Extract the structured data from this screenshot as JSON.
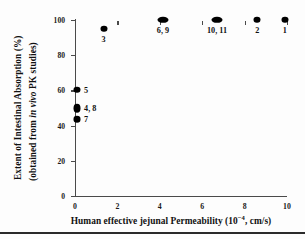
{
  "chart_data": {
    "type": "scatter",
    "title": "",
    "xlabel": "Human effective jejunal Permeability (10−4, cm/s)",
    "ylabel_line1": "Extent of Intestinal Absorption (%)",
    "ylabel_line2_pre": "(obtained from ",
    "ylabel_line2_italic": "in vivo",
    "ylabel_line2_post": " PK studies)",
    "xlim": [
      0,
      10
    ],
    "ylim": [
      0,
      100
    ],
    "xticks": [
      "0",
      "2",
      "4",
      "6",
      "8",
      "10"
    ],
    "xtick_values": [
      0,
      2,
      4,
      6,
      8,
      10
    ],
    "yticks": [
      "0",
      "20",
      "40",
      "60",
      "80",
      "100"
    ],
    "ytick_values": [
      0,
      20,
      40,
      60,
      80,
      100
    ],
    "grid": false,
    "legend": "none",
    "marker_color": "#000000",
    "axis_color": "#4a4a4a",
    "points": [
      {
        "label": "1",
        "x": 9.9,
        "y": 100,
        "label_pos": "below",
        "shape": "normal"
      },
      {
        "label": "2",
        "x": 8.6,
        "y": 100,
        "label_pos": "below",
        "shape": "normal"
      },
      {
        "label": "3",
        "x": 1.35,
        "y": 95.0,
        "label_pos": "below",
        "shape": "normal"
      },
      {
        "label": "4, 8",
        "x": 0.1,
        "y": 50.0,
        "label_pos": "right",
        "shape": "tall"
      },
      {
        "label": "5",
        "x": 0.1,
        "y": 60.5,
        "label_pos": "right",
        "shape": "normal"
      },
      {
        "label": "6, 9",
        "x": 4.15,
        "y": 100,
        "label_pos": "below",
        "shape": "wide"
      },
      {
        "label": "7",
        "x": 0.1,
        "y": 43.5,
        "label_pos": "right",
        "shape": "normal"
      },
      {
        "label": "10, 11",
        "x": 6.7,
        "y": 100,
        "label_pos": "below",
        "shape": "wide"
      }
    ]
  }
}
